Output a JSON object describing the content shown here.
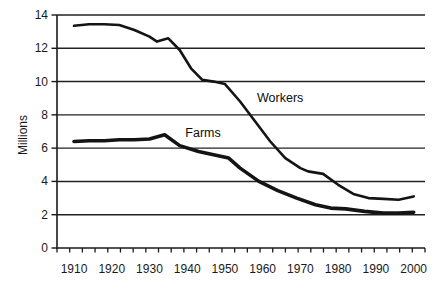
{
  "figure": {
    "background": "#ffffff",
    "line_color": "#141414",
    "grid_color": "#222222",
    "axis_color": "#1a1a1a",
    "text_color": "#1a1a1a"
  },
  "chart_data": {
    "type": "line",
    "title": "",
    "xlabel": "",
    "ylabel": "Millions",
    "xlim": [
      1905.5,
      2003
    ],
    "ylim": [
      0,
      14
    ],
    "x_ticks": [
      1910,
      1920,
      1930,
      1940,
      1950,
      1960,
      1970,
      1980,
      1990,
      2000
    ],
    "y_ticks": [
      0,
      2,
      4,
      6,
      8,
      10,
      12,
      14
    ],
    "y_gridlines": [
      2,
      4,
      6,
      8,
      10,
      12,
      14
    ],
    "x_minor_tick_count": 30,
    "grid": true,
    "legend_position": "inline-annotations",
    "series": [
      {
        "name": "Workers",
        "stroke_width": 2.6,
        "label_anchor": {
          "year": 1958.5,
          "value": 9.1
        },
        "points": [
          [
            1910,
            13.35
          ],
          [
            1914,
            13.45
          ],
          [
            1918,
            13.45
          ],
          [
            1922,
            13.4
          ],
          [
            1926,
            13.1
          ],
          [
            1930,
            12.7
          ],
          [
            1932,
            12.4
          ],
          [
            1935,
            12.6
          ],
          [
            1938,
            11.9
          ],
          [
            1941,
            10.8
          ],
          [
            1944,
            10.1
          ],
          [
            1947,
            10.0
          ],
          [
            1950,
            9.85
          ],
          [
            1954,
            8.8
          ],
          [
            1958,
            7.6
          ],
          [
            1962,
            6.4
          ],
          [
            1966,
            5.4
          ],
          [
            1970,
            4.8
          ],
          [
            1972,
            4.6
          ],
          [
            1976,
            4.45
          ],
          [
            1980,
            3.8
          ],
          [
            1984,
            3.25
          ],
          [
            1988,
            3.0
          ],
          [
            1992,
            2.95
          ],
          [
            1996,
            2.9
          ],
          [
            2000,
            3.1
          ]
        ]
      },
      {
        "name": "Farms",
        "stroke_width": 3.6,
        "label_anchor": {
          "year": 1939.5,
          "value": 7.0
        },
        "points": [
          [
            1910,
            6.4
          ],
          [
            1914,
            6.45
          ],
          [
            1918,
            6.45
          ],
          [
            1922,
            6.5
          ],
          [
            1926,
            6.5
          ],
          [
            1930,
            6.55
          ],
          [
            1934,
            6.8
          ],
          [
            1938,
            6.15
          ],
          [
            1943,
            5.8
          ],
          [
            1947,
            5.6
          ],
          [
            1951,
            5.4
          ],
          [
            1954,
            4.8
          ],
          [
            1959,
            4.0
          ],
          [
            1964,
            3.45
          ],
          [
            1969,
            3.0
          ],
          [
            1974,
            2.6
          ],
          [
            1978,
            2.4
          ],
          [
            1982,
            2.35
          ],
          [
            1987,
            2.2
          ],
          [
            1992,
            2.1
          ],
          [
            1996,
            2.1
          ],
          [
            2000,
            2.15
          ]
        ]
      }
    ]
  }
}
